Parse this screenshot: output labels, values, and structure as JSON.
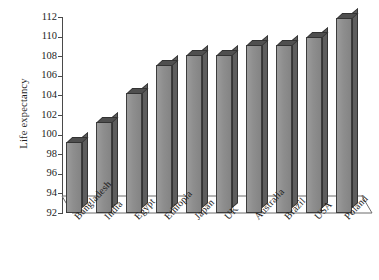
{
  "chart_data": {
    "type": "bar",
    "title": "",
    "xlabel": "",
    "ylabel": "Life expectancy",
    "categories": [
      "Bangladesh",
      "India",
      "Egypt",
      "Ethiopia",
      "Japan",
      "UK",
      "Australia",
      "Brazil",
      "USA",
      "Poland"
    ],
    "values": [
      99.2,
      101.3,
      104.2,
      107.1,
      108.1,
      108.1,
      109.1,
      109.1,
      110.0,
      111.9
    ],
    "ylim": [
      92,
      112
    ],
    "ytick_step": 2,
    "yticks": [
      92,
      94,
      96,
      98,
      100,
      102,
      104,
      106,
      108,
      110,
      112
    ],
    "ytick_labels": [
      "92",
      "94",
      "96",
      "98",
      "100",
      "102",
      "104",
      "106",
      "108",
      "110",
      "112"
    ],
    "grid": false,
    "legend": "none",
    "style": "3d-bar",
    "colors": {
      "bar_front": "#8e8e8e",
      "bar_side": "#5e5e5e",
      "bar_top": "#4f4f4f",
      "outline": "#3d3d3d",
      "axis": "#4a4a4a",
      "background": "#ffffff",
      "text": "#1d1d1d"
    }
  }
}
